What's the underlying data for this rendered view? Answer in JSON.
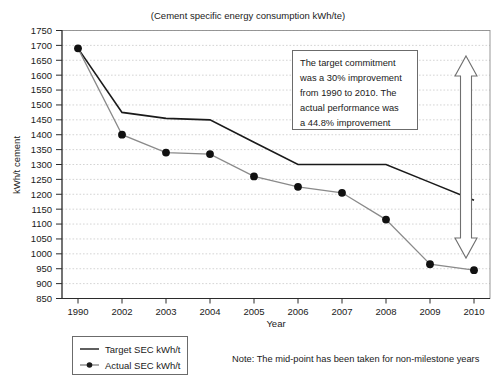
{
  "chart_data": {
    "type": "line",
    "title": "(Cement specific energy consumption kWh/te)",
    "xlabel": "Year",
    "ylabel": "kWh/t cement",
    "categories": [
      "1990",
      "2002",
      "2003",
      "2004",
      "2005",
      "2006",
      "2007",
      "2008",
      "2009",
      "2010"
    ],
    "ylim": [
      850,
      1750
    ],
    "ytick_step": 50,
    "yticks": [
      "1750",
      "1700",
      "1650",
      "1600",
      "1550",
      "1500",
      "1450",
      "1400",
      "1350",
      "1300",
      "1250",
      "1200",
      "1150",
      "1100",
      "1050",
      "1000",
      "950",
      "900",
      "850"
    ],
    "grid": true,
    "legend_position": "below-left",
    "series": [
      {
        "name": "Target SEC kWh/t",
        "values": [
          1690,
          1475,
          1455,
          1450,
          1375,
          1300,
          1300,
          1300,
          1240,
          1180
        ],
        "color": "#1a1a1a",
        "marker": "none"
      },
      {
        "name": "Actual SEC kWh/t",
        "values": [
          1690,
          1400,
          1340,
          1335,
          1260,
          1225,
          1205,
          1115,
          965,
          945
        ],
        "color": "#8a8a8a",
        "marker": "circle"
      }
    ],
    "annotations": [
      {
        "name": "target-commitment-note",
        "lines": [
          "The target commitment",
          "was a 30% improvement",
          "from 1990 to 2010. The",
          "actual performance was",
          "a 44.8% improvement"
        ]
      }
    ],
    "footnote": "Note: The mid-point has been taken for non-milestone years",
    "range_arrow": {
      "name": "improvement-range-arrow",
      "double_headed": true
    }
  }
}
